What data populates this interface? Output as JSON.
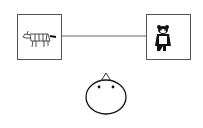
{
  "diagram": {
    "nodes": [
      {
        "id": "left",
        "icon": "zebra-icon",
        "label": ""
      },
      {
        "id": "right",
        "icon": "bear-icon",
        "label": ""
      }
    ],
    "edge": {
      "from": "left",
      "to": "right"
    },
    "figure": {
      "icon": "round-head-with-hat-icon"
    },
    "colors": {
      "stroke": "#555555",
      "ink": "#111111",
      "background": "#ffffff"
    }
  }
}
